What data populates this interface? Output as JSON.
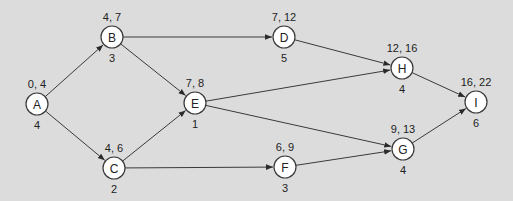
{
  "diagram": {
    "type": "activity-on-node network",
    "background": "#dcdcdc",
    "nodes": [
      {
        "id": "A",
        "label": "A",
        "times": "0, 4",
        "duration": "4",
        "x": 37,
        "y": 104
      },
      {
        "id": "B",
        "label": "B",
        "times": "4, 7",
        "duration": "3",
        "x": 112,
        "y": 37
      },
      {
        "id": "C",
        "label": "C",
        "times": "4, 6",
        "duration": "2",
        "x": 114,
        "y": 168
      },
      {
        "id": "D",
        "label": "D",
        "times": "7, 12",
        "duration": "5",
        "x": 284,
        "y": 37
      },
      {
        "id": "E",
        "label": "E",
        "times": "7, 8",
        "duration": "1",
        "x": 195,
        "y": 103
      },
      {
        "id": "F",
        "label": "F",
        "times": "6, 9",
        "duration": "3",
        "x": 285,
        "y": 167
      },
      {
        "id": "H",
        "label": "H",
        "times": "12, 16",
        "duration": "4",
        "x": 402,
        "y": 68
      },
      {
        "id": "G",
        "label": "G",
        "times": "9, 13",
        "duration": "4",
        "x": 403,
        "y": 149
      },
      {
        "id": "I",
        "label": "I",
        "times": "16, 22",
        "duration": "6",
        "x": 476,
        "y": 102
      }
    ],
    "edges": [
      {
        "from": "A",
        "to": "B"
      },
      {
        "from": "A",
        "to": "C"
      },
      {
        "from": "B",
        "to": "D"
      },
      {
        "from": "B",
        "to": "E"
      },
      {
        "from": "C",
        "to": "E"
      },
      {
        "from": "C",
        "to": "F"
      },
      {
        "from": "D",
        "to": "H"
      },
      {
        "from": "E",
        "to": "H"
      },
      {
        "from": "E",
        "to": "G"
      },
      {
        "from": "F",
        "to": "G"
      },
      {
        "from": "H",
        "to": "I"
      },
      {
        "from": "G",
        "to": "I"
      }
    ]
  }
}
